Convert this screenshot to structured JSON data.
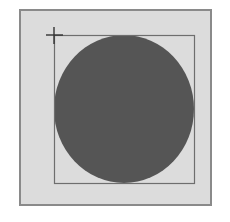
{
  "canvas": {
    "background": "#dcdcdc",
    "border": "#8a8a8a"
  },
  "selection_rect": {
    "x": 54,
    "y": 35,
    "width": 140,
    "height": 148,
    "stroke": "#6e6e6e"
  },
  "ellipse": {
    "cx": 124,
    "cy": 109,
    "rx": 70,
    "ry": 74,
    "fill": "#555555"
  },
  "cursor": {
    "type": "crosshair-icon",
    "x": 54,
    "y": 35
  }
}
